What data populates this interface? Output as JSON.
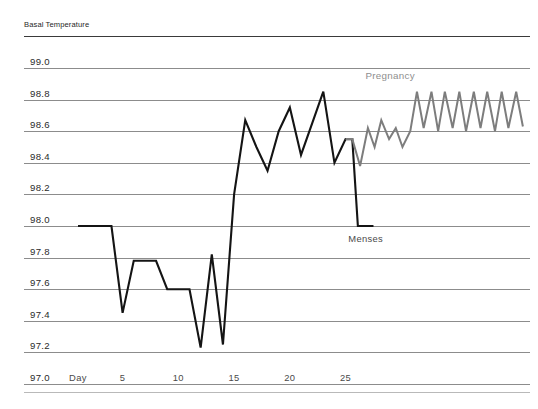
{
  "chart_data": {
    "type": "line",
    "title": "Basal Temperature",
    "xlabel": "Day",
    "ylabel": "Basal Temperature",
    "ylim": [
      97.0,
      99.0
    ],
    "xlim": [
      1,
      41
    ],
    "grid": true,
    "legend_position": "inline-annotations",
    "y_ticks": [
      "99.0",
      "98.8",
      "98.6",
      "98.4",
      "98.2",
      "98.0",
      "97.8",
      "97.6",
      "97.4",
      "97.2",
      "97.0"
    ],
    "y_tick_values": [
      99.0,
      98.8,
      98.6,
      98.4,
      98.2,
      98.0,
      97.8,
      97.6,
      97.4,
      97.2,
      97.0
    ],
    "x_ticks": [
      "Day",
      "5",
      "10",
      "15",
      "20",
      "25"
    ],
    "x_tick_values": [
      1,
      5,
      10,
      15,
      20,
      25
    ],
    "annotations": [
      {
        "text": "Pregnancy",
        "x": 29.0,
        "y": 98.93,
        "color": "#8e8e8e"
      },
      {
        "text": "Menses",
        "x": 26.8,
        "y": 97.9,
        "color": "#4a4a4a"
      }
    ],
    "series": [
      {
        "name": "Menses",
        "color": "#141414",
        "width": 2.1,
        "x": [
          1,
          2,
          3,
          4,
          5,
          6,
          7,
          8,
          9,
          10,
          11,
          12,
          13,
          14,
          15,
          16,
          17,
          18,
          19,
          20,
          21,
          22,
          23,
          24,
          25,
          25.6,
          26.1,
          27.5
        ],
        "values": [
          98.0,
          98.0,
          98.0,
          98.0,
          97.45,
          97.78,
          97.78,
          97.78,
          97.6,
          97.6,
          97.6,
          97.23,
          97.82,
          97.25,
          98.2,
          98.67,
          98.5,
          98.35,
          98.6,
          98.75,
          98.45,
          98.65,
          98.85,
          98.4,
          98.55,
          98.55,
          98.0,
          98.0
        ]
      },
      {
        "name": "Pregnancy",
        "color": "#7d7d7d",
        "width": 2.0,
        "x": [
          25,
          25.6,
          26.3,
          27.0,
          27.6,
          28.2,
          28.9,
          29.5,
          30.1,
          30.8,
          31.4,
          32.0,
          32.7,
          33.3,
          33.9,
          34.6,
          35.2,
          35.8,
          36.5,
          37.1,
          37.7,
          38.4,
          39.0,
          39.6,
          40.3,
          40.9
        ],
        "values": [
          98.55,
          98.55,
          98.38,
          98.62,
          98.5,
          98.67,
          98.55,
          98.62,
          98.5,
          98.6,
          98.85,
          98.62,
          98.85,
          98.6,
          98.85,
          98.62,
          98.85,
          98.6,
          98.85,
          98.62,
          98.85,
          98.6,
          98.85,
          98.62,
          98.85,
          98.63
        ]
      }
    ]
  },
  "colors": {
    "menses": "#141414",
    "pregnancy": "#7d7d7d",
    "gridline": "#8c8c8c",
    "background": "#ffffff"
  }
}
